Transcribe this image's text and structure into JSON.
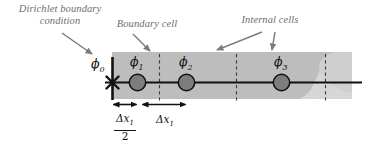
{
  "figure": {
    "type": "mesh-schematic",
    "colors": {
      "band_fill": "#bdbdbd",
      "band_fill_light": "#cfcfcf",
      "node_fill": "#7d7d7d",
      "node_stroke": "#111111",
      "line": "#111111",
      "annotation_text": "#6e6e6e",
      "dashed_line": "#3a3a3a",
      "background": "#ffffff"
    }
  },
  "annotations": [
    {
      "id": "dirichlet",
      "text": "Dirichlet boundary\ncondition",
      "arrow": "down-right"
    },
    {
      "id": "boundary",
      "text": "Boundary cell",
      "arrow": "down-right"
    },
    {
      "id": "internal",
      "text": "Internal cells",
      "arrow": "down-left-and-down-right"
    }
  ],
  "nodes": [
    {
      "id": "phi0",
      "label": "ϕ",
      "subscript": "0",
      "marker": "cross",
      "on_boundary": true
    },
    {
      "id": "phi1",
      "label": "ϕ",
      "subscript": "1",
      "marker": "circle",
      "on_boundary": false
    },
    {
      "id": "phi2",
      "label": "ϕ",
      "subscript": "2",
      "marker": "circle",
      "on_boundary": false
    },
    {
      "id": "phi3",
      "label": "ϕ",
      "subscript": "3",
      "marker": "circle",
      "on_boundary": false
    }
  ],
  "dimensions": [
    {
      "id": "half-dx1",
      "numerator": "Δx",
      "numerator_sub": "1",
      "denominator": "2",
      "is_fraction": true
    },
    {
      "id": "dx1",
      "numerator": "Δx",
      "numerator_sub": "1",
      "denominator": "",
      "is_fraction": false
    }
  ],
  "cell_faces": {
    "count": 4,
    "style": "dashed"
  },
  "axis": {
    "style": "solid",
    "direction": "x"
  }
}
